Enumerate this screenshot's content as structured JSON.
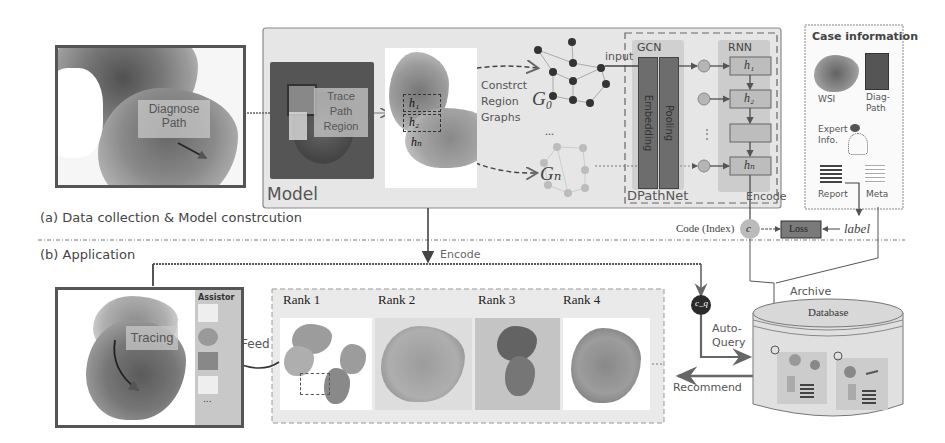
{
  "section_a": {
    "title": "(a) Data collection & Model constrcution",
    "diagnose_overlay": [
      "Diagnose",
      "Path"
    ],
    "model_box_label": "Model",
    "trace_overlay": [
      "Trace",
      "Path",
      "Region"
    ],
    "region_labels": [
      "h₁",
      "h₂",
      "hₙ"
    ],
    "construct_label": [
      "Constrct",
      "Region",
      "Graphs"
    ],
    "graph_labels": {
      "g0": "G₀",
      "gn": "Gₙ",
      "ellipsis": "..."
    },
    "input_label": "input",
    "gcn": {
      "title": "GCN",
      "layers": [
        "Embedding",
        "Pooling"
      ]
    },
    "rnn": {
      "title": "RNN",
      "cells": [
        "h₁",
        "h₂",
        "",
        "hₙ"
      ]
    },
    "dpathnet_label": "DPathNet",
    "encode_label": "Encode",
    "case_info": {
      "title": "Case information",
      "items": [
        "WSI",
        "Diag-Path",
        "Expert Info.",
        "Report",
        "Meta"
      ]
    },
    "code_label": "Code (Index)",
    "code_symbol": "c",
    "loss_label": "Loss",
    "label_text": "label"
  },
  "section_b": {
    "title": "(b) Application",
    "encode_arrow_label": "Encode",
    "tracing_label": "Tracing",
    "assistor_title": "Assistor",
    "assistor_more": "...",
    "feed_label": "Feed",
    "ranks": [
      "Rank 1",
      "Rank 2",
      "Rank 3",
      "Rank 4"
    ],
    "ranks_more": "...",
    "query_symbol": "c_q",
    "auto_query_label": [
      "Auto-",
      "Query"
    ],
    "recommend_label": "Recommend",
    "archive_label": "Archive",
    "database_label": "Database"
  },
  "colors": {
    "model_bg": "#e4e4e4",
    "dark_frame": "#555555",
    "gcn_layer": "#6d6d6d",
    "rnn_cell": "#bdbdbd",
    "loss_box": "#7a7a7a",
    "query_node": "#2a2a2a"
  }
}
